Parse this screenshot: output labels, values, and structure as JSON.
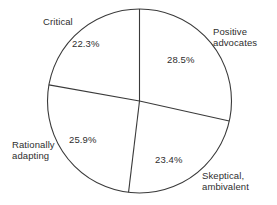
{
  "chart_data": {
    "type": "pie",
    "title": "",
    "subtitle": "",
    "xlabel": "",
    "ylabel": "",
    "legend": "none",
    "grid": false,
    "start_angle_deg": 0,
    "direction": "clockwise",
    "center": {
      "x": 139.5,
      "y": 101
    },
    "radius": 92,
    "stroke_color": "#3a3a3a",
    "slice_fill": "#ffffff",
    "categories": [
      "Positive advocates",
      "Skeptical, ambivalent",
      "Rationally adapting",
      "Critical"
    ],
    "values": [
      28.5,
      23.4,
      25.9,
      22.3
    ],
    "value_labels": [
      "28.5%",
      "23.4%",
      "25.9%",
      "22.3%"
    ],
    "slices": [
      {
        "name": "Positive advocates",
        "label_line1": "Positive",
        "label_line2": "advocates",
        "label_text": "Positive\nadvocates",
        "value": 28.5,
        "value_label": "28.5%",
        "start_angle_deg": 0,
        "end_angle_deg": 102.6
      },
      {
        "name": "Skeptical, ambivalent",
        "label_line1": "Skeptical,",
        "label_line2": "ambivalent",
        "label_text": "Skeptical,\nambivalent",
        "value": 23.4,
        "value_label": "23.4%",
        "start_angle_deg": 102.6,
        "end_angle_deg": 186.84
      },
      {
        "name": "Rationally adapting",
        "label_line1": "Rationally",
        "label_line2": "adapting",
        "label_text": "Rationally\nadapting",
        "value": 25.9,
        "value_label": "25.9%",
        "start_angle_deg": 186.84,
        "end_angle_deg": 280.08
      },
      {
        "name": "Critical",
        "label_line1": "Critical",
        "label_line2": "",
        "label_text": "Critical",
        "value": 22.3,
        "value_label": "22.3%",
        "start_angle_deg": 280.08,
        "end_angle_deg": 360
      }
    ]
  }
}
